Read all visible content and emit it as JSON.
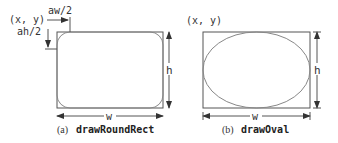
{
  "panel_a": {
    "origin_label": "(x, y)",
    "arc_width_label": "aw/2",
    "arc_height_label": "ah/2",
    "height_label": "h",
    "width_label": "w",
    "caption_prefix": "(a)",
    "caption_method": "drawRoundRect"
  },
  "panel_b": {
    "origin_label": "(x, y)",
    "height_label": "h",
    "width_label": "w",
    "caption_prefix": "(b)",
    "caption_method": "drawOval"
  }
}
